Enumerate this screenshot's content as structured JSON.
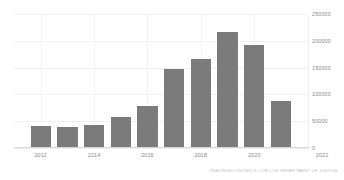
{
  "chart_data": {
    "type": "bar",
    "title": "",
    "xlabel": "",
    "ylabel": "",
    "categories": [
      "2012",
      "2013",
      "2014",
      "2015",
      "2016",
      "2017",
      "2018",
      "2019",
      "2020",
      "2021"
    ],
    "values": [
      41000,
      39000,
      43000,
      58000,
      78000,
      148000,
      166000,
      216000,
      193000,
      88000
    ],
    "ylim": [
      0,
      250000
    ],
    "y_ticks": [
      0,
      50000,
      100000,
      150000,
      200000,
      250000
    ],
    "y_tick_labels": [
      "0",
      "50000",
      "100000",
      "150000",
      "200000",
      "250000"
    ],
    "x_tick_labels": [
      "2012",
      "2014",
      "2016",
      "2018",
      "2020",
      "2022"
    ],
    "grid": true,
    "legend": false,
    "bar_color": "#7b7b7b",
    "background_color": "#ffffff",
    "grid_color": "#f0f0f0",
    "axis_text_color": "#8a8a8a"
  },
  "footer": {
    "source_site": "TRADINGECONOMICS.COM",
    "separator": "|",
    "source_org": "US DEPARTMENT OF JUSTICE"
  },
  "header": {
    "cropped_title": ""
  }
}
